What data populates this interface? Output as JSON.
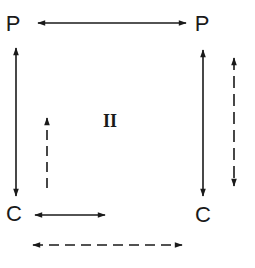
{
  "diagram": {
    "nodes": {
      "top_left": {
        "label": "P",
        "x": 13,
        "y": 24
      },
      "top_right": {
        "label": "P",
        "x": 202,
        "y": 24
      },
      "bottom_left": {
        "label": "C",
        "x": 14,
        "y": 214
      },
      "bottom_right": {
        "label": "C",
        "x": 203,
        "y": 215
      }
    },
    "region_label": {
      "text": "II",
      "x": 110,
      "y": 120
    },
    "edges": [
      {
        "id": "top-horizontal",
        "style": "solid",
        "heads": "both",
        "from": [
          38,
          23
        ],
        "to": [
          186,
          23
        ]
      },
      {
        "id": "left-vertical",
        "style": "solid",
        "heads": "both",
        "from": [
          16,
          48
        ],
        "to": [
          16,
          196
        ]
      },
      {
        "id": "inner-left-dashed",
        "style": "dashed",
        "heads": "end",
        "from": [
          47,
          188
        ],
        "to": [
          47,
          118
        ]
      },
      {
        "id": "right-vertical",
        "style": "solid",
        "heads": "both",
        "from": [
          203,
          50
        ],
        "to": [
          203,
          196
        ]
      },
      {
        "id": "right-dashed",
        "style": "dashed",
        "heads": "both",
        "from": [
          234,
          58
        ],
        "to": [
          234,
          186
        ]
      },
      {
        "id": "bottom-short",
        "style": "solid",
        "heads": "both",
        "from": [
          35,
          215
        ],
        "to": [
          105,
          215
        ]
      },
      {
        "id": "bottom-dashed",
        "style": "dashed",
        "heads": "both",
        "from": [
          33,
          245
        ],
        "to": [
          182,
          245
        ]
      }
    ],
    "colors": {
      "ink": "#1a1a1a",
      "background": "#ffffff"
    }
  }
}
